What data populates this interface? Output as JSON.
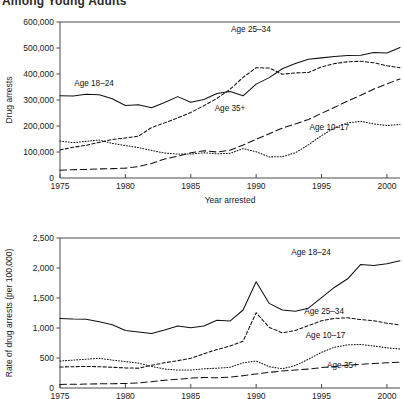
{
  "title_partial": "Among Young Adults",
  "panels": [
    {
      "name": "drug-arrests-counts",
      "ylabel": "Drug arrests",
      "xlabel": "Year arrested",
      "yticks": [
        "0",
        "100,000",
        "200,000",
        "300,000",
        "400,000",
        "500,000",
        "600,000"
      ],
      "xticks": [
        "1975",
        "1980",
        "1985",
        "1990",
        "1995",
        "2000"
      ],
      "series_labels": [
        {
          "text": "Age 18–24",
          "x": 1977.6,
          "y": 352000
        },
        {
          "text": "Age 25–34",
          "x": 1989.6,
          "y": 560000
        },
        {
          "text": "Age 35+",
          "x": 1988.0,
          "y": 258000
        },
        {
          "text": "Age 10–17",
          "x": 1995.6,
          "y": 185000
        }
      ]
    },
    {
      "name": "drug-arrests-rates",
      "ylabel": "Rate of drug arrests (per 100,000)",
      "xlabel": "",
      "yticks": [
        "0",
        "500",
        "1,000",
        "1,500",
        "2,000",
        "2,500"
      ],
      "xticks": [
        "1975",
        "1980",
        "1985",
        "1990",
        "1995",
        "2000"
      ],
      "series_labels": [
        {
          "text": "Age 18–24",
          "x": 1994.2,
          "y": 2220
        },
        {
          "text": "Age 25–34",
          "x": 1995.2,
          "y": 1230
        },
        {
          "text": "Age 10–17",
          "x": 1995.3,
          "y": 830
        },
        {
          "text": "Age 35+",
          "x": 1996.6,
          "y": 330
        }
      ]
    }
  ],
  "chart_data": [
    {
      "type": "line",
      "title": "Drug arrests by age group",
      "xlabel": "Year arrested",
      "ylabel": "Drug arrests",
      "xlim": [
        1975,
        2001
      ],
      "ylim": [
        0,
        600000
      ],
      "grid": false,
      "legend_position": "inline-labels",
      "x": [
        1975,
        1976,
        1977,
        1978,
        1979,
        1980,
        1981,
        1982,
        1983,
        1984,
        1985,
        1986,
        1987,
        1988,
        1989,
        1990,
        1991,
        1992,
        1993,
        1994,
        1995,
        1996,
        1997,
        1998,
        1999,
        2000,
        2001
      ],
      "series": [
        {
          "name": "Age 18–24",
          "style": "solid",
          "values": [
            316000,
            315000,
            322000,
            320000,
            305000,
            279000,
            282000,
            270000,
            290000,
            313000,
            291000,
            302000,
            325000,
            333000,
            316000,
            361000,
            386000,
            420000,
            440000,
            457000,
            462000,
            467000,
            471000,
            472000,
            483000,
            481000,
            502000
          ]
        },
        {
          "name": "Age 25–34",
          "style": "short-dash",
          "values": [
            108000,
            118000,
            126000,
            137000,
            148000,
            154000,
            161000,
            194000,
            212000,
            231000,
            252000,
            278000,
            306000,
            341000,
            387000,
            424000,
            423000,
            399000,
            404000,
            406000,
            427000,
            440000,
            447000,
            449000,
            443000,
            432000,
            424000
          ]
        },
        {
          "name": "Age 10–17",
          "style": "dotted",
          "values": [
            142000,
            136000,
            141000,
            146000,
            133000,
            125000,
            117000,
            106000,
            96000,
            92000,
            92000,
            97000,
            93000,
            95000,
            113000,
            101000,
            81000,
            82000,
            97000,
            128000,
            163000,
            193000,
            212000,
            218000,
            208000,
            202000,
            206000
          ]
        },
        {
          "name": "Age 35+",
          "style": "long-dash",
          "values": [
            30000,
            32000,
            33000,
            35000,
            36000,
            38000,
            44000,
            56000,
            73000,
            84000,
            97000,
            105000,
            100000,
            107000,
            127000,
            149000,
            170000,
            192000,
            208000,
            225000,
            249000,
            272000,
            296000,
            318000,
            342000,
            362000,
            381000
          ]
        }
      ],
      "annotations": [
        "Age 25–34 and Age 18–24 peak sharply around 1989",
        "Age 25–34 exceeds Age 18–24 only near the 1989 peak"
      ]
    },
    {
      "type": "line",
      "title": "Rate of drug arrests by age group",
      "xlabel": "Year arrested",
      "ylabel": "Rate of drug arrests (per 100,000)",
      "xlim": [
        1975,
        2001
      ],
      "ylim": [
        0,
        2500
      ],
      "grid": false,
      "legend_position": "inline-labels",
      "x": [
        1975,
        1976,
        1977,
        1978,
        1979,
        1980,
        1981,
        1982,
        1983,
        1984,
        1985,
        1986,
        1987,
        1988,
        1989,
        1990,
        1991,
        1992,
        1993,
        1994,
        1995,
        1996,
        1997,
        1998,
        1999,
        2000,
        2001
      ],
      "series": [
        {
          "name": "Age 18–24",
          "style": "solid",
          "values": [
            1160,
            1150,
            1145,
            1105,
            1055,
            960,
            935,
            910,
            965,
            1035,
            1005,
            1035,
            1130,
            1115,
            1300,
            1770,
            1410,
            1300,
            1280,
            1330,
            1505,
            1680,
            1820,
            2060,
            2040,
            2070,
            2120
          ]
        },
        {
          "name": "Age 25–34",
          "style": "short-dash",
          "values": [
            350,
            355,
            360,
            355,
            345,
            335,
            330,
            380,
            420,
            455,
            495,
            570,
            640,
            700,
            780,
            1255,
            1010,
            920,
            960,
            1040,
            1120,
            1160,
            1170,
            1140,
            1120,
            1080,
            1050
          ]
        },
        {
          "name": "Age 10–17",
          "style": "dotted",
          "values": [
            450,
            465,
            480,
            495,
            465,
            440,
            415,
            360,
            315,
            300,
            300,
            320,
            330,
            345,
            420,
            450,
            355,
            320,
            375,
            480,
            595,
            680,
            720,
            725,
            700,
            670,
            650
          ]
        },
        {
          "name": "Age 35+",
          "style": "long-dash",
          "values": [
            60,
            62,
            65,
            70,
            72,
            75,
            85,
            105,
            130,
            145,
            165,
            175,
            170,
            180,
            205,
            235,
            260,
            285,
            300,
            315,
            340,
            360,
            380,
            395,
            410,
            420,
            430
          ]
        }
      ],
      "annotations": [
        "Bottom panel is cropped at the image edge below the 0 gridline"
      ]
    }
  ]
}
